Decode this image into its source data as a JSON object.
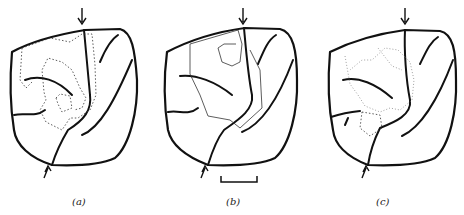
{
  "figure": {
    "panels": [
      {
        "id": "a",
        "label": "(a)",
        "path_style": "dotted-with-nodes"
      },
      {
        "id": "b",
        "label": "(b)",
        "path_style": "solid-thin-with-nodes"
      },
      {
        "id": "c",
        "label": "(c)",
        "path_style": "faint-dotted"
      }
    ],
    "scale_bar": {
      "present": true,
      "panel": "b"
    },
    "arrows": [
      "top-down-arrow",
      "bottom-up-arrow"
    ]
  }
}
